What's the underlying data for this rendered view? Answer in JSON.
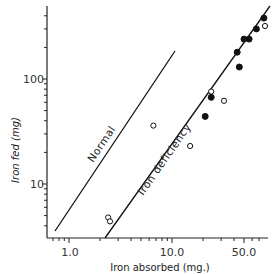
{
  "chart_data": {
    "type": "scatter",
    "title": "",
    "xlabel": "Iron absorbed (mg.)",
    "ylabel": "Iron fed (mg)",
    "xscale": "log",
    "yscale": "log",
    "xlim": [
      0.55,
      100
    ],
    "ylim": [
      1.8,
      550
    ],
    "x_tick_labels": [
      "1.0",
      "10.0",
      "50.0"
    ],
    "x_ticks": [
      1.0,
      10.0,
      50.0
    ],
    "y_tick_labels": [
      "10",
      "100"
    ],
    "y_ticks": [
      10,
      100
    ],
    "grid": false,
    "legend": null,
    "lines": [
      {
        "name": "Normal",
        "label": "Normal",
        "x": [
          0.67,
          14.3
        ],
        "y": [
          2.3,
          120
        ]
      },
      {
        "name": "Iron deficiency",
        "label": "Iron deficiency",
        "x": [
          2.1,
          82
        ],
        "y": [
          1.8,
          290
        ]
      }
    ],
    "series": [
      {
        "name": "filled",
        "marker": "filled-circle",
        "points": [
          {
            "x": 78,
            "y": 380
          },
          {
            "x": 66,
            "y": 300
          },
          {
            "x": 50,
            "y": 240
          },
          {
            "x": 56,
            "y": 240
          },
          {
            "x": 43,
            "y": 180
          },
          {
            "x": 45,
            "y": 130
          },
          {
            "x": 24,
            "y": 67
          },
          {
            "x": 21,
            "y": 44
          }
        ]
      },
      {
        "name": "open",
        "marker": "open-circle",
        "points": [
          {
            "x": 80,
            "y": 320
          },
          {
            "x": 24,
            "y": 76
          },
          {
            "x": 32,
            "y": 62
          },
          {
            "x": 6.6,
            "y": 36
          },
          {
            "x": 15,
            "y": 23
          },
          {
            "x": 2.4,
            "y": 4.8
          },
          {
            "x": 2.5,
            "y": 4.4
          }
        ]
      }
    ],
    "annotations": [
      "Normal",
      "Iron deficiency"
    ]
  },
  "axes": {
    "x_title": "Iron absorbed (mg.)",
    "y_title": "Iron fed (mg)",
    "x_labels": [
      "1.0",
      "10.0",
      "50.0"
    ],
    "y_labels": [
      "100",
      "10"
    ]
  },
  "labels": {
    "normal": "Normal",
    "iron_deficiency": "Iron deficiency"
  },
  "colors": {
    "ink": "#111111",
    "background": "#ffffff"
  }
}
